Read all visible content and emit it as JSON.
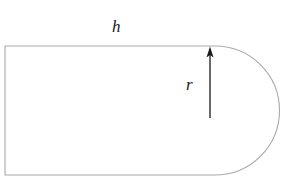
{
  "figure": {
    "type": "geometry-diagram",
    "background_color": "#ffffff",
    "outline_color": "#a9a9a9",
    "outline_width": 1,
    "annotation_color": "#1a1a1a",
    "labels": [
      {
        "id": "h",
        "text": "h",
        "meaning": "height-or-length-label",
        "style": "italic",
        "position": {
          "x": 120,
          "y": 30
        },
        "placement": "above-top-edge"
      },
      {
        "id": "r",
        "text": "r",
        "meaning": "radius-label",
        "style": "italic",
        "position": {
          "x": 192,
          "y": 85
        },
        "placement": "left-of-arrow"
      }
    ],
    "shape": {
      "name": "stadium-end-region",
      "rect": {
        "x": 5,
        "y": 46,
        "width": 210,
        "height": 129
      },
      "semicircle": {
        "center_x": 215,
        "center_y": 110.5,
        "radius": 64.5,
        "side": "right"
      }
    },
    "arrow": {
      "name": "radius-arrow",
      "orientation": "vertical",
      "direction": "up",
      "x": 210,
      "y_tail": 118,
      "y_head": 47,
      "head_width": 7,
      "head_length": 11,
      "color": "#1a1a1a"
    }
  }
}
